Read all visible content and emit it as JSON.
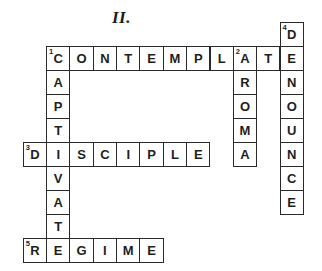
{
  "puzzle": {
    "title": "II.",
    "words": [
      {
        "number": "1",
        "direction": "across",
        "answer": "CONTEMPLATE",
        "row": 1,
        "col": 1
      },
      {
        "number": "1",
        "direction": "down",
        "answer": "CAPTIVATE",
        "row": 1,
        "col": 1
      },
      {
        "number": "2",
        "direction": "down",
        "answer": "AROMA",
        "row": 1,
        "col": 9
      },
      {
        "number": "3",
        "direction": "across",
        "answer": "DISCIPLE",
        "row": 5,
        "col": 0
      },
      {
        "number": "4",
        "direction": "down",
        "answer": "DENOUNCE",
        "row": 0,
        "col": 11
      },
      {
        "number": "5",
        "direction": "across",
        "answer": "REGIME",
        "row": 9,
        "col": 0
      }
    ]
  }
}
